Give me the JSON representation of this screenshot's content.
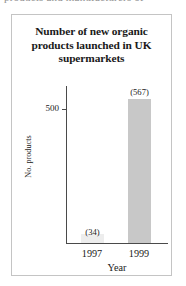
{
  "page": {
    "cutoff_text_top": "products and manufacturers of"
  },
  "chart_data": {
    "type": "bar",
    "title": "Number of new organic products launched in UK supermarkets",
    "title_lines": [
      "Number of new organic",
      "products launched in UK",
      "supermarkets"
    ],
    "categories": [
      "1997",
      "1999"
    ],
    "values": [
      34,
      567
    ],
    "value_labels": [
      "(34)",
      "(567)"
    ],
    "xlabel": "Year",
    "ylabel": "No. products",
    "ytick_labels": [
      "500"
    ],
    "yticks": [
      500
    ],
    "ylim": [
      0,
      620
    ],
    "grid": false,
    "legend": false,
    "bar_color": "#c8c8c8",
    "axis_color": "#4a4a4a",
    "border_color": "#c4c4c4"
  }
}
